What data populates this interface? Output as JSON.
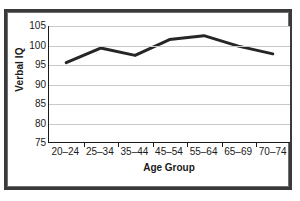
{
  "chart_data": {
    "type": "line",
    "title": "",
    "xlabel": "Age Group",
    "ylabel": "Verbal IQ",
    "categories": [
      "20–24",
      "25–34",
      "35–44",
      "45–54",
      "55–64",
      "65–69",
      "70–74"
    ],
    "values": [
      95.5,
      99.3,
      97.4,
      101.5,
      102.5,
      99.8,
      97.8
    ],
    "series": [
      {
        "name": "Verbal IQ",
        "values": [
          95.5,
          99.3,
          97.4,
          101.5,
          102.5,
          99.8,
          97.8
        ]
      }
    ],
    "ylim": [
      75,
      105
    ],
    "yticks": [
      105,
      100,
      95,
      90,
      85,
      80,
      75
    ],
    "ytick_labels": [
      "105",
      "100",
      "95",
      "90",
      "85",
      "80",
      "75"
    ],
    "grid": true,
    "grid_axis": "y",
    "legend": false,
    "legend_position": "none",
    "line_color": "#262626",
    "line_width": 3,
    "markers": false,
    "plot_background": "#ffffff",
    "grid_color": "#c9c9c9",
    "axis_color": "#1a1a1a",
    "frame_color": "#3a3a3a"
  },
  "figure": {
    "background": "#ffffff",
    "border_color": "#3a3a3a"
  }
}
